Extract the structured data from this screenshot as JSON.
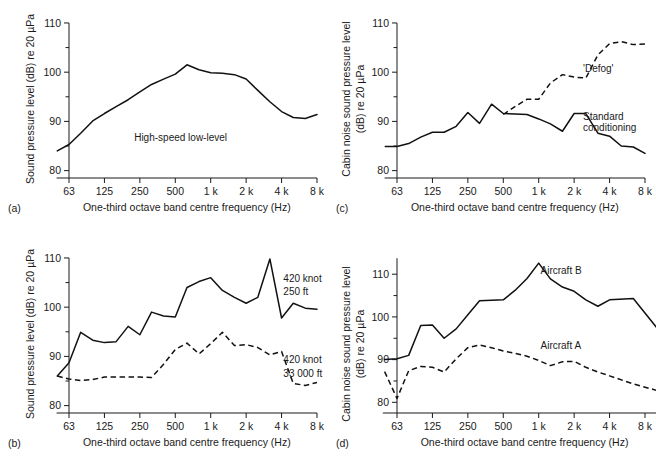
{
  "figure": {
    "background": "#ffffff",
    "line_color": "#111111",
    "panels": [
      "a",
      "b",
      "c",
      "d"
    ]
  },
  "chart_data": [
    {
      "id": "a",
      "panel_letter": "(a)",
      "type": "line",
      "title": "",
      "xlabel": "One-third octave band centre frequency (Hz)",
      "ylabel": "Sound pressure level (dB) re 20 µPa",
      "xtick_labels": [
        "63",
        "125",
        "250",
        "500",
        "1 k",
        "2 k",
        "4 k",
        "8 k"
      ],
      "xtick_octaves": [
        0,
        1,
        2,
        3,
        4,
        5,
        6,
        7
      ],
      "xlim": [
        -0.35,
        7.0
      ],
      "ylim": [
        78.5,
        110.6
      ],
      "ytick_labels": [
        "80",
        "90",
        "100",
        "110"
      ],
      "ytick_values": [
        80,
        90,
        100,
        110
      ],
      "yminor_values": [
        85,
        95,
        105
      ],
      "grid": false,
      "legend_position": "inline-annotation",
      "annotations": [
        {
          "text": "High-speed low-level",
          "x_octave": 3.15,
          "y": 86.0,
          "anchor": "middle"
        }
      ],
      "series": [
        {
          "name": "High-speed low-level",
          "style": "solid",
          "x_octaves": [
            -0.33,
            0.0,
            0.33,
            0.67,
            1.0,
            1.33,
            1.67,
            2.0,
            2.33,
            2.67,
            3.0,
            3.33,
            3.67,
            4.0,
            4.33,
            4.67,
            5.0,
            5.33,
            5.67,
            6.0,
            6.33,
            6.67,
            7.0
          ],
          "values": [
            84.0,
            85.3,
            87.6,
            90.1,
            91.6,
            93.0,
            94.4,
            96.0,
            97.5,
            98.6,
            99.6,
            101.5,
            100.5,
            99.9,
            99.8,
            99.5,
            98.6,
            96.3,
            94.0,
            92.0,
            90.8,
            90.6,
            91.4,
            92.2
          ]
        }
      ]
    },
    {
      "id": "b",
      "panel_letter": "(b)",
      "type": "line",
      "title": "",
      "xlabel": "One-third octave band centre frequency (Hz)",
      "ylabel": "Sound pressure level (dB) re 20 µPa",
      "xtick_labels": [
        "63",
        "125",
        "250",
        "500",
        "1 k",
        "2 k",
        "4 k",
        "8 k"
      ],
      "xtick_octaves": [
        0,
        1,
        2,
        3,
        4,
        5,
        6,
        7
      ],
      "xlim": [
        -0.35,
        7.0
      ],
      "ylim": [
        78.5,
        110.6
      ],
      "ytick_labels": [
        "80",
        "90",
        "100",
        "110"
      ],
      "ytick_values": [
        80,
        90,
        100,
        110
      ],
      "yminor_values": [
        85,
        95,
        105
      ],
      "grid": false,
      "legend_position": "inline-annotation",
      "annotations": [
        {
          "text": "420 knot",
          "x_octave": 6.05,
          "y": 105.2,
          "anchor": "start"
        },
        {
          "text": "250 ft",
          "x_octave": 6.05,
          "y": 102.4,
          "anchor": "start"
        },
        {
          "text": "420 knot",
          "x_octave": 6.05,
          "y": 88.6,
          "anchor": "start"
        },
        {
          "text": "33 000 ft",
          "x_octave": 6.05,
          "y": 85.8,
          "anchor": "start"
        }
      ],
      "series": [
        {
          "name": "420 knot 250 ft",
          "style": "solid",
          "x_octaves": [
            -0.33,
            0.0,
            0.33,
            0.67,
            1.0,
            1.33,
            1.67,
            2.0,
            2.33,
            2.67,
            3.0,
            3.33,
            3.67,
            4.0,
            4.33,
            4.67,
            5.0,
            5.33,
            5.67,
            6.0,
            6.33,
            6.67,
            7.0
          ],
          "values": [
            86.0,
            88.7,
            94.9,
            93.3,
            92.8,
            93.0,
            96.1,
            94.4,
            99.0,
            98.2,
            98.0,
            104.0,
            105.2,
            106.0,
            103.4,
            102.0,
            100.8,
            102.0,
            109.8,
            97.8,
            100.8,
            99.8,
            99.6,
            96.6
          ]
        },
        {
          "name": "420 knot 33 000 ft",
          "style": "dashed",
          "x_octaves": [
            -0.33,
            0.0,
            0.33,
            0.67,
            1.0,
            1.33,
            1.67,
            2.0,
            2.33,
            2.67,
            3.0,
            3.33,
            3.67,
            4.0,
            4.33,
            4.67,
            5.0,
            5.33,
            5.67,
            6.0,
            6.33,
            6.67,
            7.0
          ],
          "values": [
            86.0,
            85.4,
            85.1,
            85.3,
            85.8,
            85.8,
            85.8,
            85.8,
            85.7,
            88.4,
            91.4,
            92.7,
            90.5,
            92.6,
            94.9,
            92.2,
            92.4,
            91.8,
            90.3,
            91.0,
            84.5,
            84.1,
            84.7,
            83.6,
            82.8
          ]
        }
      ]
    },
    {
      "id": "c",
      "panel_letter": "(c)",
      "type": "line",
      "title": "",
      "xlabel": "One-third octave band centre frequency (Hz)",
      "ylabel": "Cabin noise sound pressure level (dB) re 20 µPa",
      "xtick_labels": [
        "63",
        "125",
        "250",
        "500",
        "1 k",
        "2 k",
        "4 k",
        "8 k"
      ],
      "xtick_octaves": [
        0,
        1,
        2,
        3,
        4,
        5,
        6,
        7
      ],
      "xlim": [
        -0.35,
        7.0
      ],
      "ylim": [
        78.5,
        110.6
      ],
      "ytick_labels": [
        "80",
        "90",
        "100",
        "110"
      ],
      "ytick_values": [
        80,
        90,
        100,
        110
      ],
      "yminor_values": [
        85,
        95,
        105
      ],
      "grid": false,
      "legend_position": "inline-annotation",
      "annotations": [
        {
          "text": "'Defog'",
          "x_octave": 5.25,
          "y": 100.0,
          "anchor": "start"
        },
        {
          "text": "Standard",
          "x_octave": 5.25,
          "y": 90.3,
          "anchor": "start"
        },
        {
          "text": "conditioning",
          "x_octave": 5.25,
          "y": 88.0,
          "anchor": "start"
        }
      ],
      "series": [
        {
          "name": "Standard conditioning",
          "style": "solid",
          "x_octaves": [
            -0.33,
            0.0,
            0.33,
            0.67,
            1.0,
            1.33,
            1.67,
            2.0,
            2.33,
            2.67,
            3.0,
            3.33,
            3.67,
            4.0,
            4.33,
            4.67,
            5.0,
            5.33,
            5.67,
            6.0,
            6.33,
            6.67,
            7.0
          ],
          "values": [
            84.9,
            84.9,
            85.5,
            86.8,
            87.8,
            87.8,
            89.0,
            91.8,
            89.6,
            93.5,
            91.6,
            91.5,
            91.4,
            90.5,
            89.5,
            88.0,
            91.6,
            91.6,
            87.6,
            87.0,
            85.0,
            84.8,
            83.5,
            84.5,
            84.5
          ]
        },
        {
          "name": "'Defog'",
          "style": "dashed",
          "x_octaves": [
            3.0,
            3.33,
            3.67,
            4.0,
            4.33,
            4.67,
            5.0,
            5.33,
            5.67,
            6.0,
            6.33,
            6.67,
            7.0
          ],
          "values": [
            91.4,
            93.0,
            94.5,
            94.5,
            97.8,
            99.5,
            99.0,
            98.8,
            103.5,
            105.8,
            106.2,
            105.6,
            105.7,
            105.7
          ]
        }
      ]
    },
    {
      "id": "d",
      "panel_letter": "(d)",
      "type": "line",
      "title": "",
      "xlabel": "One-third octave band centre frequency (Hz)",
      "ylabel": "Cabin noise sound pressure level (dB) re 20 µPa",
      "xtick_labels": [
        "63",
        "125",
        "250",
        "500",
        "1 k",
        "2 k",
        "4 k",
        "8 k"
      ],
      "xtick_octaves": [
        0,
        1,
        2,
        3,
        4,
        5,
        6,
        7
      ],
      "xlim": [
        -0.4,
        7.6
      ],
      "ylim": [
        77.5,
        114.5
      ],
      "ytick_labels": [
        "80",
        "90",
        "100",
        "110"
      ],
      "ytick_values": [
        80,
        90,
        100,
        110
      ],
      "yminor_values": [
        85,
        95,
        105
      ],
      "grid": false,
      "legend_position": "inline-annotation",
      "annotations": [
        {
          "text": "Aircraft B",
          "x_octave": 4.05,
          "y": 110.0,
          "anchor": "start"
        },
        {
          "text": "Aircraft A",
          "x_octave": 4.05,
          "y": 92.6,
          "anchor": "start"
        }
      ],
      "series": [
        {
          "name": "Aircraft B",
          "style": "solid",
          "x_octaves": [
            -0.35,
            0.0,
            0.33,
            0.67,
            1.0,
            1.33,
            1.67,
            2.0,
            2.33,
            2.67,
            3.0,
            3.33,
            3.67,
            4.0,
            4.33,
            4.67,
            5.0,
            5.33,
            5.67,
            6.0,
            6.67,
            7.33
          ],
          "values": [
            90.0,
            90.2,
            91.0,
            98.0,
            98.1,
            95.0,
            97.2,
            100.5,
            103.8,
            103.9,
            104.0,
            106.2,
            109.0,
            112.6,
            108.9,
            107.0,
            106.0,
            104.0,
            102.5,
            104.0,
            104.3,
            97.5,
            94.3,
            94.6
          ]
        },
        {
          "name": "Aircraft A",
          "style": "dashed",
          "x_octaves": [
            -0.35,
            0.0,
            0.33,
            0.67,
            1.0,
            1.33,
            1.67,
            2.0,
            2.33,
            2.67,
            3.0,
            3.33,
            3.67,
            4.0,
            4.33,
            4.67,
            5.0,
            5.33,
            5.67,
            6.0,
            6.67,
            7.33
          ],
          "values": [
            87.2,
            80.9,
            87.4,
            88.4,
            88.2,
            87.1,
            90.2,
            92.8,
            93.4,
            92.8,
            92.0,
            91.5,
            90.8,
            89.8,
            88.6,
            89.5,
            89.6,
            88.2,
            87.1,
            86.2,
            84.3,
            82.8,
            81.6
          ]
        }
      ]
    }
  ]
}
